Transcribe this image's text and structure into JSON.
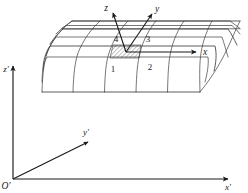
{
  "figure": {
    "caption": "",
    "background_color": "#ffffff",
    "line_color": "#3c3c3c",
    "axis_color": "#1a1a1a"
  },
  "local_axes": {
    "title": "element local coordinate system",
    "origin_label": "",
    "x_label": "x",
    "y_label": "y",
    "z_label": "z"
  },
  "global_axes": {
    "title": "global coordinate system",
    "origin_label": "O'",
    "x_label": "x'",
    "y_label": "y'",
    "z_label": "z'"
  },
  "element_nodes": [
    {
      "id": "1",
      "label": "1"
    },
    {
      "id": "2",
      "label": "2"
    },
    {
      "id": "3",
      "label": "3"
    },
    {
      "id": "4",
      "label": "4"
    }
  ],
  "mesh": {
    "name": "curved-shell-mesh",
    "rows": 4,
    "columns": 6,
    "highlighted_element": "1-2-3-4",
    "highlight_style": "hatched"
  }
}
